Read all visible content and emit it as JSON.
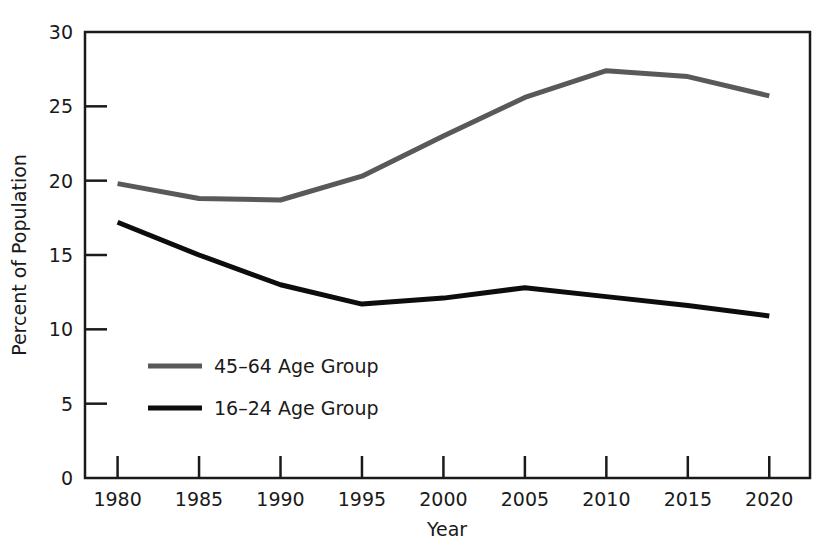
{
  "chart_data": {
    "type": "line",
    "title": "",
    "xlabel": "Year",
    "ylabel": "Percent of Population",
    "x": [
      1980,
      1985,
      1990,
      1995,
      2000,
      2005,
      2010,
      2015,
      2020
    ],
    "xtick_labels": [
      "1980",
      "1985",
      "1990",
      "1995",
      "2000",
      "2005",
      "2010",
      "2015",
      "2020"
    ],
    "ytick_labels": [
      "0",
      "5",
      "10",
      "15",
      "20",
      "25",
      "30"
    ],
    "yticks": [
      0,
      5,
      10,
      15,
      20,
      25,
      30
    ],
    "xlim": [
      1978,
      2022.5
    ],
    "ylim": [
      0,
      30
    ],
    "grid": false,
    "legend_position": "inside-lower-left",
    "series": [
      {
        "name": "45-64 Age Group",
        "legend_label": "45–64 Age Group",
        "color": "#595959",
        "line_width": 5,
        "values": [
          19.8,
          18.8,
          18.7,
          20.3,
          23.0,
          25.6,
          27.4,
          27.0,
          25.7
        ]
      },
      {
        "name": "16-24 Age Group",
        "legend_label": "16–24 Age Group",
        "color": "#0d0d0d",
        "line_width": 5,
        "values": [
          17.2,
          15.0,
          13.0,
          11.7,
          12.1,
          12.8,
          12.2,
          11.6,
          10.9
        ]
      }
    ]
  }
}
